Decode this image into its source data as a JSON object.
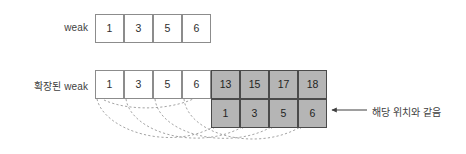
{
  "diagram": {
    "rows": [
      {
        "id": "weak",
        "label": "weak",
        "cells": [
          {
            "value": "1",
            "style": "white"
          },
          {
            "value": "3",
            "style": "white"
          },
          {
            "value": "5",
            "style": "white"
          },
          {
            "value": "6",
            "style": "white"
          }
        ]
      },
      {
        "id": "extended-weak",
        "label": "확장된 weak",
        "cells": [
          {
            "value": "1",
            "style": "white"
          },
          {
            "value": "3",
            "style": "white"
          },
          {
            "value": "5",
            "style": "white"
          },
          {
            "value": "6",
            "style": "white"
          },
          {
            "value": "13",
            "style": "gray"
          },
          {
            "value": "15",
            "style": "gray"
          },
          {
            "value": "17",
            "style": "gray"
          },
          {
            "value": "18",
            "style": "gray"
          }
        ]
      },
      {
        "id": "mapped-values",
        "label": "",
        "cells": [
          {
            "value": "1",
            "style": "gray"
          },
          {
            "value": "3",
            "style": "gray"
          },
          {
            "value": "5",
            "style": "gray"
          },
          {
            "value": "6",
            "style": "gray"
          }
        ]
      }
    ],
    "annotation": {
      "text": "해당 위치와 같음"
    },
    "colors": {
      "gray_fill": "#b5b5b5",
      "white_fill": "#ffffff",
      "white_border": "#8c8c8c",
      "gray_border": "#4a4a4a",
      "arc_stroke": "#9a9a9a",
      "arrow_stroke": "#3f3f3f",
      "text": "#3a3a3a"
    },
    "arcs": [
      {
        "from": "weak-cell-0",
        "to": "mapped-cell-0"
      },
      {
        "from": "weak-cell-1",
        "to": "mapped-cell-1"
      },
      {
        "from": "weak-cell-2",
        "to": "mapped-cell-2"
      },
      {
        "from": "weak-cell-3",
        "to": "mapped-cell-3"
      }
    ]
  }
}
